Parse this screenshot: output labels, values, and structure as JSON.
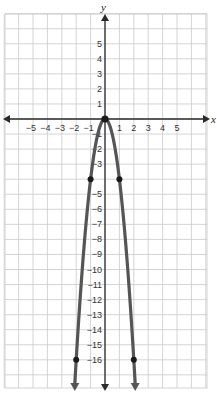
{
  "chart_data": {
    "type": "line",
    "title": "",
    "function": "y = -4x^2",
    "xlabel": "x",
    "ylabel": "y",
    "xlim": [
      -7,
      7
    ],
    "ylim": [
      -18,
      7
    ],
    "grid": true,
    "x_ticks": [
      -5,
      -4,
      -3,
      -2,
      -1,
      1,
      2,
      3,
      4,
      5
    ],
    "y_ticks": [
      5,
      4,
      3,
      2,
      1,
      -1,
      -2,
      -3,
      -5,
      -6,
      -7,
      -8,
      -9,
      -10,
      -11,
      -12,
      -13,
      -14,
      -15,
      -16
    ],
    "series": [
      {
        "name": "parabola",
        "points": [
          {
            "x": -2,
            "y": -16
          },
          {
            "x": -1,
            "y": -4
          },
          {
            "x": 0,
            "y": 0
          },
          {
            "x": 1,
            "y": -4
          },
          {
            "x": 2,
            "y": -16
          }
        ],
        "arrows_both_ends": true
      }
    ],
    "colors": {
      "grid": "#c9c9c9",
      "axis": "#2a2a2a",
      "curve": "#555555",
      "point": "#1a1a1a"
    }
  },
  "labels": {
    "x_axis": "x",
    "y_axis": "y"
  }
}
